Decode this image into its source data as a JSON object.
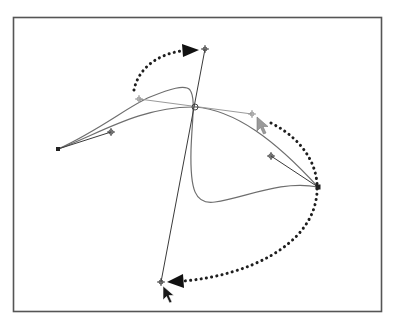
{
  "diagram": {
    "title": "",
    "colors": {
      "frame": "#555555",
      "curve": "#6e6e6e",
      "handle_line": "#3a3a3a",
      "handle_line_muted": "#9a9a9a",
      "dotted_arrow": "#1e1e1e",
      "anchor_point": "#222222"
    },
    "elements": {
      "frame": {
        "x": 13,
        "y": 17,
        "width": 369,
        "height": 295
      },
      "anchor_points": [
        {
          "name": "left-anchor",
          "x": 58,
          "y": 149
        },
        {
          "name": "center-anchor",
          "x": 195,
          "y": 107
        },
        {
          "name": "right-anchor",
          "x": 318,
          "y": 187
        }
      ],
      "control_points": [
        {
          "name": "left-handle",
          "x": 111,
          "y": 132
        },
        {
          "name": "top-left-handle-original",
          "x": 139,
          "y": 99
        },
        {
          "name": "right-handle-original",
          "x": 252,
          "y": 114
        },
        {
          "name": "top-handle-rotated",
          "x": 205,
          "y": 49
        },
        {
          "name": "bottom-handle-rotated",
          "x": 161,
          "y": 282
        },
        {
          "name": "right-anchor-handle",
          "x": 271,
          "y": 156
        }
      ],
      "dotted_arrows": [
        {
          "name": "rotation-arrow-top",
          "from": [
            134,
            90
          ],
          "to": [
            190,
            50
          ]
        },
        {
          "name": "rotation-arrow-bottom",
          "from": [
            271,
            123
          ],
          "to": [
            170,
            281
          ]
        }
      ],
      "cursors": [
        {
          "name": "cursor-right-handle",
          "x": 257,
          "y": 117,
          "style": "grey"
        },
        {
          "name": "cursor-bottom-handle",
          "x": 163,
          "y": 286,
          "style": "black"
        }
      ],
      "labels": []
    }
  }
}
